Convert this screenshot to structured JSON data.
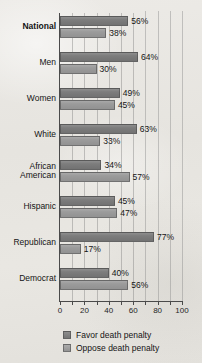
{
  "chart_data": {
    "type": "bar",
    "orientation": "horizontal",
    "title": "",
    "xlabel": "",
    "ylabel": "",
    "xlim": [
      0,
      100
    ],
    "xticks": [
      0,
      10,
      20,
      30,
      40,
      50,
      60,
      70,
      80,
      90,
      100
    ],
    "xtick_labels": [
      "0",
      "20",
      "40",
      "60",
      "80",
      "100"
    ],
    "xtick_label_values": [
      0,
      20,
      40,
      60,
      80,
      100
    ],
    "grid": true,
    "legend_position": "bottom",
    "categories": [
      "National",
      "Men",
      "Women",
      "White",
      "African\nAmerican",
      "Hispanic",
      "Republican",
      "Democrat"
    ],
    "emphasized_categories": [
      "National"
    ],
    "series": [
      {
        "name": "Favor death penalty",
        "color": "#7d7d7d",
        "values": [
          56,
          64,
          49,
          63,
          34,
          45,
          77,
          40
        ],
        "value_labels": [
          "56%",
          "64%",
          "49%",
          "63%",
          "34%",
          "45%",
          "77%",
          "40%"
        ]
      },
      {
        "name": "Oppose death penalty",
        "color": "#9b9b9b",
        "values": [
          38,
          30,
          45,
          33,
          57,
          47,
          17,
          56
        ],
        "value_labels": [
          "38%",
          "30%",
          "45%",
          "33%",
          "57%",
          "47%",
          "17%",
          "56%"
        ]
      }
    ]
  },
  "legend": {
    "items": [
      {
        "label": "Favor death penalty",
        "swatch": "favor"
      },
      {
        "label": "Oppose death penalty",
        "swatch": "oppose"
      }
    ]
  }
}
